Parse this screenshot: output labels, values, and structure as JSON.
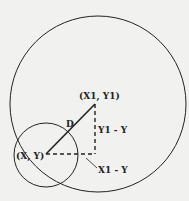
{
  "diagram": {
    "labels": {
      "point_xy": "(X, Y)",
      "point_x1y1": "(X1, Y1)",
      "distance": "D",
      "vertical_leg": "Y1 - Y",
      "horizontal_leg": "X1 - Y"
    },
    "colors": {
      "background": "#f1f1ef",
      "stroke": "#222222"
    }
  }
}
